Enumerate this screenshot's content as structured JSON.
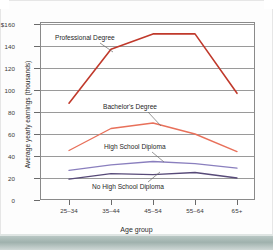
{
  "chart_data": {
    "type": "line",
    "title": "",
    "xlabel": "Age group",
    "ylabel": "Average yearly earnings (thousands)",
    "categories": [
      "25–34",
      "35–44",
      "45–54",
      "55–64",
      "65+"
    ],
    "ylim": [
      0,
      160
    ],
    "yticks": [
      0,
      20,
      40,
      60,
      80,
      100,
      120,
      140,
      160
    ],
    "ytick_labels": [
      "0",
      "20",
      "40",
      "60",
      "80",
      "100",
      "120",
      "140",
      "$160"
    ],
    "grid": "horizontal",
    "legend": "inline-annotations",
    "series": [
      {
        "name": "Professional Degree",
        "color": "#c0392b",
        "values": [
          88,
          137,
          151,
          151,
          97
        ]
      },
      {
        "name": "Bachelor's Degree",
        "color": "#e8705a",
        "values": [
          45,
          65,
          70,
          60,
          44
        ]
      },
      {
        "name": "High School Diploma",
        "color": "#8a7fbe",
        "values": [
          27,
          32,
          35,
          33,
          29
        ]
      },
      {
        "name": "No High School Diploma",
        "color": "#574a78",
        "values": [
          19,
          24,
          23,
          25,
          20
        ]
      }
    ],
    "annotations": [
      {
        "text": "Professional Degree",
        "series": "Professional Degree"
      },
      {
        "text": "Bachelor's Degree",
        "series": "Bachelor's Degree"
      },
      {
        "text": "High School Diploma",
        "series": "High School Diploma"
      },
      {
        "text": "No High School Diploma",
        "series": "No High School Diploma"
      }
    ]
  },
  "colors": {
    "professional": "#c0392b",
    "bachelors": "#e8705a",
    "high_school": "#8a7fbe",
    "no_high_school": "#574a78",
    "grid": "#9a9a9a",
    "frame": "#8a8a8a",
    "band": "#9fb1ad"
  }
}
